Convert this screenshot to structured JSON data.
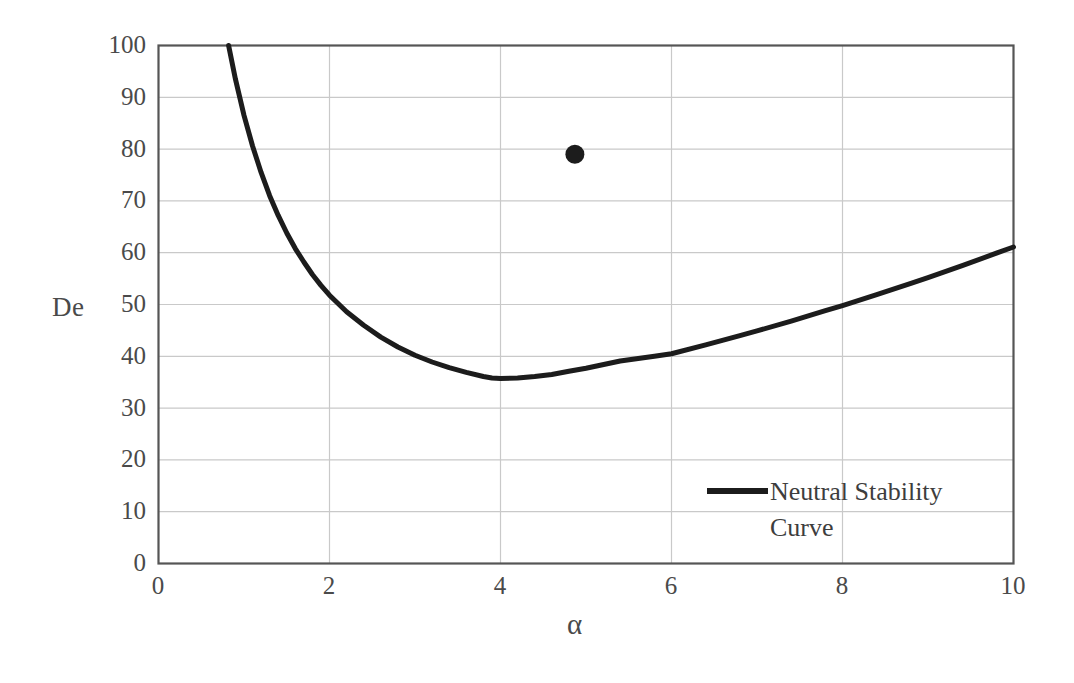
{
  "chart_data": {
    "type": "line",
    "title": "",
    "subtitle": "",
    "xlabel": "α",
    "ylabel": "De",
    "xlim": [
      0,
      10
    ],
    "ylim": [
      0,
      100
    ],
    "xticks": [
      "0",
      "2",
      "4",
      "6",
      "8",
      "10"
    ],
    "xtick_values": [
      0,
      2,
      4,
      6,
      8,
      10
    ],
    "yticks": [
      "0",
      "10",
      "20",
      "30",
      "40",
      "50",
      "60",
      "70",
      "80",
      "90",
      "100"
    ],
    "ytick_values": [
      0,
      10,
      20,
      30,
      40,
      50,
      60,
      70,
      80,
      90,
      100
    ],
    "grid": true,
    "grid_color": "#c9c9c9",
    "frame_color": "#555555",
    "background": "#ffffff",
    "legend_position": "inside-lower-right",
    "series": [
      {
        "name": "Neutral Stability Curve",
        "type": "line",
        "color": "#1c1c1c",
        "linewidth": 5,
        "x": [
          0.82,
          0.9,
          1.0,
          1.1,
          1.2,
          1.3,
          1.4,
          1.5,
          1.6,
          1.7,
          1.8,
          1.9,
          2.0,
          2.2,
          2.4,
          2.6,
          2.8,
          3.0,
          3.2,
          3.4,
          3.6,
          3.8,
          3.9,
          4.0,
          4.2,
          4.4,
          4.6,
          4.8,
          5.0,
          5.4,
          5.8,
          6.0,
          6.4,
          6.8,
          7.0,
          7.4,
          7.8,
          8.0,
          8.4,
          8.8,
          9.0,
          9.4,
          9.8,
          10.0
        ],
        "y": [
          100.0,
          93.5,
          86.5,
          80.6,
          75.5,
          71.0,
          67.2,
          63.8,
          60.8,
          58.2,
          55.8,
          53.7,
          51.8,
          48.6,
          46.0,
          43.7,
          41.8,
          40.2,
          38.9,
          37.8,
          36.9,
          36.1,
          35.8,
          35.7,
          35.8,
          36.1,
          36.5,
          37.1,
          37.7,
          39.1,
          40.0,
          40.5,
          42.2,
          44.0,
          44.9,
          46.8,
          48.8,
          49.8,
          51.9,
          54.1,
          55.2,
          57.5,
          59.9,
          61.1
        ]
      },
      {
        "name": "data-point",
        "type": "scatter",
        "color": "#1c1c1c",
        "marker": "filled-circle",
        "marker_size": 19,
        "x": [
          4.87
        ],
        "y": [
          79.0
        ]
      }
    ],
    "annotations": []
  },
  "legend": {
    "line_swatch_color": "#1c1c1c",
    "entries": [
      {
        "label_line_1": "Neutral Stability",
        "label_line_2": "Curve"
      }
    ]
  },
  "axes": {
    "y_title": "De",
    "x_title": "α"
  }
}
